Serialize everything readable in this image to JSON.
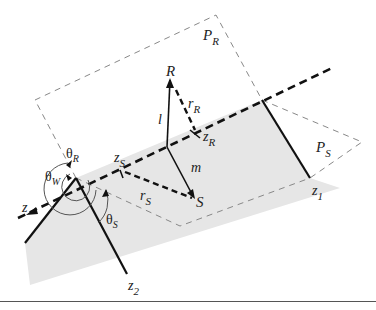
{
  "diagram": {
    "type": "geometric-wedge-diagram",
    "colors": {
      "wedge_fill": "#e6e6e6",
      "plane_dash": "#777777",
      "line": "#111111"
    },
    "labels": {
      "plane_R": "P",
      "plane_R_sub": "R",
      "plane_S": "P",
      "plane_S_sub": "S",
      "receiver": "R",
      "source": "S",
      "l": "l",
      "m": "m",
      "r_R": "r",
      "r_R_sub": "R",
      "r_S": "r",
      "r_S_sub": "S",
      "z_R": "z",
      "z_R_sub": "R",
      "z_S": "z",
      "z_S_sub": "S",
      "z_axis": "z",
      "z1": "z",
      "z1_sub": "1",
      "z2": "z",
      "z2_sub": "2",
      "theta_R": "θ",
      "theta_R_sub": "R",
      "theta_W": "θ",
      "theta_W_sub": "W",
      "theta_S": "θ",
      "theta_S_sub": "S"
    }
  }
}
